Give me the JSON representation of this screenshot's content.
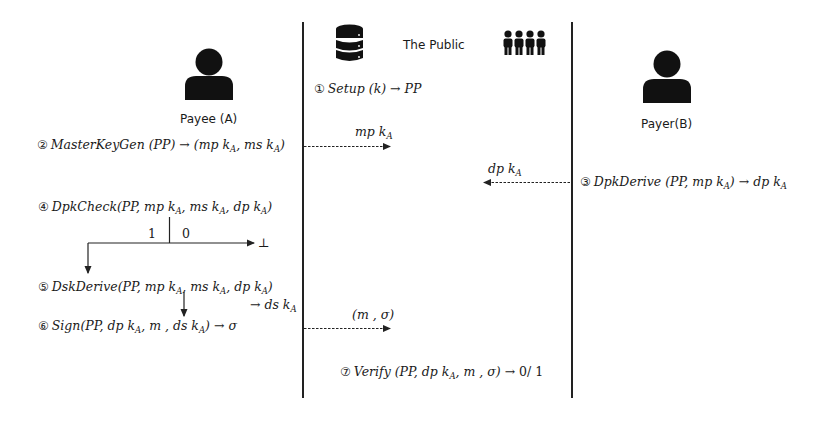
{
  "lanes": {
    "payee": {
      "label": "Payee (A)",
      "icon": "person-icon"
    },
    "public": {
      "label": "The Public",
      "icons": [
        "database-icon",
        "group-people-icon"
      ]
    },
    "payer": {
      "label": "Payer(B)",
      "icon": "person-icon"
    }
  },
  "steps": [
    {
      "num": "①",
      "name": "Setup",
      "args": "(k)",
      "arrow": "→",
      "result": "PP"
    },
    {
      "num": "②",
      "name": "MasterKeyGen",
      "args": "(PP)",
      "arrow": "→",
      "result_parts": [
        "(mp k",
        "A",
        ", ms k",
        "A",
        ")"
      ]
    },
    {
      "num": "③",
      "name": "DpkDerive",
      "args_parts": [
        "(PP, mp k",
        "A",
        ")"
      ],
      "arrow": "→",
      "result_parts": [
        "dp k",
        "A"
      ]
    },
    {
      "num": "④",
      "name": "DpkCheck",
      "args_parts": [
        "(PP, mp k",
        "A",
        ", ms k",
        "A",
        ", dp k",
        "A",
        ")"
      ]
    },
    {
      "num": "⑤",
      "name": "DskDerive",
      "args_parts": [
        "(PP, mp k",
        "A",
        ", ms k",
        "A",
        ", dp k",
        "A",
        ")"
      ],
      "result_parts": [
        "→ ds k",
        "A"
      ]
    },
    {
      "num": "⑥",
      "name": "Sign",
      "args_parts": [
        "(PP, dp k",
        "A",
        ", m , ds k",
        "A",
        ")"
      ],
      "arrow": "→",
      "result": "σ"
    },
    {
      "num": "⑦",
      "name": "Verify",
      "args_parts": [
        "(PP, dp k",
        "A",
        ", m , σ)"
      ],
      "arrow": "→",
      "result": "0/ 1"
    }
  ],
  "branch": {
    "left_label": "1",
    "right_label": "0",
    "fail_symbol": "⊥"
  },
  "messages": [
    {
      "label_parts": [
        "mp k",
        "A"
      ],
      "direction": "right"
    },
    {
      "label_parts": [
        "dp k",
        "A"
      ],
      "direction": "left"
    },
    {
      "label": "(m , σ)",
      "direction": "right"
    }
  ]
}
